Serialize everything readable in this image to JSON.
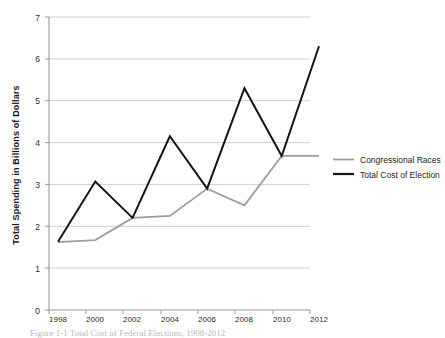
{
  "chart_data": {
    "type": "line",
    "title": "",
    "xlabel": "",
    "ylabel": "Total Spending in Billions of Dollars",
    "categories": [
      "1998",
      "2000",
      "2002",
      "2004",
      "2006",
      "2008",
      "2010",
      "2012"
    ],
    "ylim": [
      0,
      7
    ],
    "ytick_labels": [
      "0",
      "1",
      "2",
      "3",
      "4",
      "5",
      "6",
      "7"
    ],
    "ytick_values": [
      0,
      1,
      2,
      3,
      4,
      5,
      6,
      7
    ],
    "grid": "horizontal",
    "legend_position": "right",
    "series": [
      {
        "name": "Congressional Races",
        "color": "#9d9d9d",
        "values": [
          1.62,
          1.67,
          2.2,
          2.25,
          2.9,
          2.5,
          3.68,
          3.68
        ]
      },
      {
        "name": "Total Cost of Election",
        "color": "#151515",
        "values": [
          1.63,
          3.07,
          2.2,
          4.15,
          2.9,
          5.3,
          3.68,
          6.3
        ]
      }
    ]
  },
  "legend": {
    "entries": [
      {
        "label": "Congressional Races"
      },
      {
        "label": "Total Cost of Election"
      }
    ]
  },
  "caption": {
    "text": "Figure 1-1   Total Cost of Federal Elections, 1998-2012"
  }
}
